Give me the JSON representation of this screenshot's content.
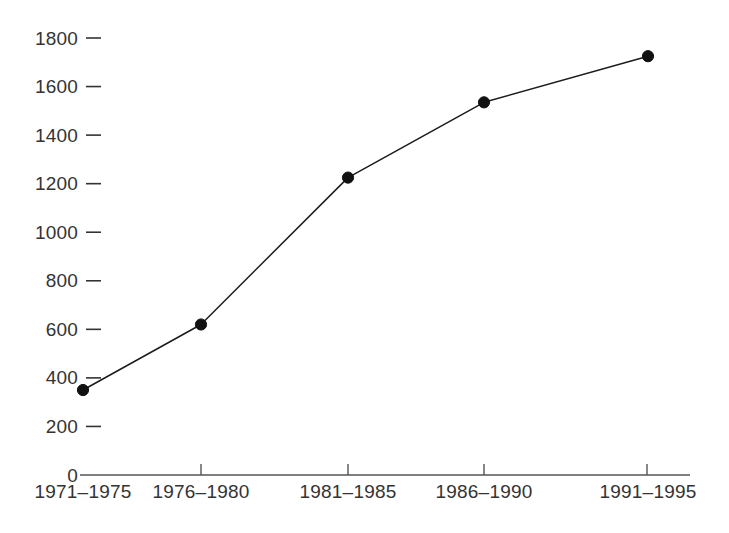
{
  "chart_data": {
    "type": "line",
    "title": "",
    "subtitle": "",
    "xlabel": "",
    "ylabel": "",
    "categories": [
      "1971–1975",
      "1976–1980",
      "1981–1985",
      "1986–1990",
      "1991–1995"
    ],
    "values": [
      350,
      620,
      1225,
      1535,
      1725
    ],
    "series": [
      {
        "name": "",
        "values": [
          350,
          620,
          1225,
          1535,
          1725
        ]
      }
    ],
    "ylim": [
      0,
      1800
    ],
    "xlim": [
      0,
      4
    ],
    "y_ticks": [
      0,
      200,
      400,
      600,
      800,
      1000,
      1200,
      1400,
      1600,
      1800
    ],
    "y_tick_labels": [
      "0",
      "200",
      "400",
      "600",
      "800",
      "1000",
      "1200",
      "1400",
      "1600",
      "1800"
    ],
    "x_tick_labels": [
      "1971–1975",
      "1976–1980",
      "1981–1985",
      "1986–1990",
      "1991–1995"
    ],
    "grid": false,
    "legend": false,
    "legend_position": "none",
    "marker": "filled-circle",
    "annotations": [],
    "colors": {
      "background": "#ffffff",
      "line": "#1c1c1c",
      "marker": "#111111",
      "axis": "#555555",
      "text": "#333333"
    }
  }
}
